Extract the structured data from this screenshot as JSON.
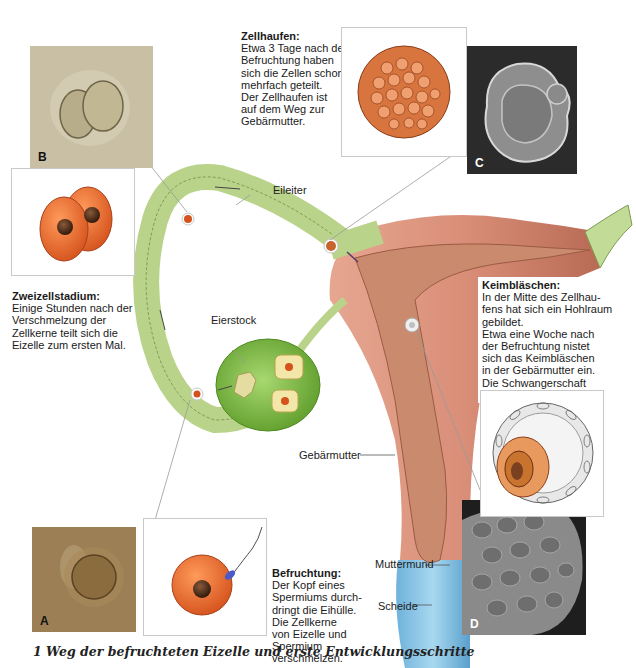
{
  "figure": {
    "caption": "1  Weg der befruchteten Eizelle und erste Entwicklungsschritte"
  },
  "anatomy_labels": {
    "eileiter": "Eileiter",
    "eierstock": "Eierstock",
    "gebaermutter": "Gebärmutter",
    "muttermund": "Muttermund",
    "scheide": "Scheide"
  },
  "photos": {
    "A": {
      "label": "A",
      "description": "Eizelle (Mikroskopaufnahme)",
      "bg": "#9c7f55"
    },
    "B": {
      "label": "B",
      "description": "Zweizellstadium (Mikroskopaufnahme)",
      "bg": "#c9bfa5"
    },
    "C": {
      "label": "C",
      "description": "Zellhaufen (Elektronenmikroskop)",
      "bg": "#2b2b2b"
    },
    "D": {
      "label": "D",
      "description": "Keimbläschen (Elektronenmikroskop)",
      "bg": "#1e1e1e"
    }
  },
  "descriptions": {
    "zellhaufen": {
      "title": "Zellhaufen:",
      "lines": [
        "Etwa 3 Tage nach der",
        "Befruchtung haben",
        "sich die Zellen schon",
        "mehrfach geteilt.",
        "Der Zellhaufen ist",
        "auf dem Weg zur",
        "Gebärmutter."
      ]
    },
    "zweizellstadium": {
      "title": "Zweizellstadium:",
      "lines": [
        "Einige Stunden nach der",
        "Verschmelzung der",
        "Zellkerne teilt sich die",
        "Eizelle zum ersten Mal."
      ]
    },
    "keimblaeschen": {
      "title": "Keimbläschen:",
      "lines": [
        "In der Mitte des Zellhau-",
        "fens hat sich ein Hohlraum",
        "gebildet.",
        "Etwa eine Woche nach",
        "der Befruchtung nistet",
        "sich das Keimbläschen",
        "in der Gebärmutter ein.",
        "Die Schwangerschaft",
        "beginnt."
      ]
    },
    "befruchtung": {
      "title": "Befruchtung:",
      "lines": [
        "Der Kopf eines",
        "Spermiums durch-",
        "dringt die Eihülle.",
        "Die Zellkerne",
        "von Eizelle und",
        "Spermium",
        "verschmelzen."
      ]
    }
  },
  "colors": {
    "oviduct_green": "#b9d48a",
    "ovary_green": "#7fbf3f",
    "uterus_pink": "#d98e78",
    "endometrium": "#c98a6e",
    "vagina_blue": "#8cc6e8",
    "egg_orange": "#e8662a",
    "nucleus_brown": "#4a2a1a"
  }
}
